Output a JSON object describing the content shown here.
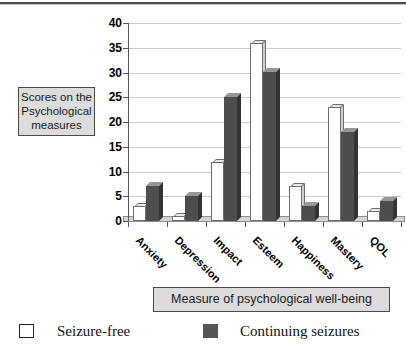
{
  "chart_data": {
    "type": "bar",
    "style": "3d-column",
    "categories": [
      "Anxiety",
      "Depression",
      "Impact",
      "Esteem",
      "Happiness",
      "Mastery",
      "QOL"
    ],
    "series": [
      {
        "name": "Seizure-free",
        "values": [
          3,
          1,
          12,
          36,
          7,
          23,
          2
        ],
        "color": "#ffffff"
      },
      {
        "name": "Continuing seizures",
        "values": [
          7,
          5,
          25,
          30,
          3,
          18,
          4
        ],
        "color": "#4d4d4d"
      }
    ],
    "title": "",
    "xlabel": "Measure of psychological well-being",
    "ylabel": "Scores on the Psychological measures",
    "ylim": [
      0,
      40
    ],
    "ytick_step": 5,
    "grid": true,
    "legend_position": "bottom"
  },
  "ylabel_box": {
    "lines": [
      "Scores on the",
      "Psychological",
      "measures"
    ]
  },
  "colors": {
    "seizure_free_bar": "#ffffff",
    "continuing_seizures_bar": "#4d4d4d",
    "gridline": "#cccccc",
    "label_box_fill": "#dcdcdc",
    "floor": "#d4d4d4"
  }
}
